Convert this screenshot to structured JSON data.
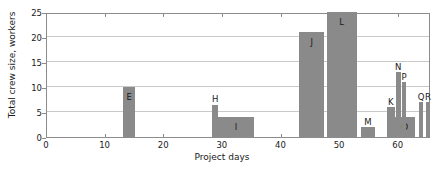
{
  "chart_data": {
    "type": "bar",
    "title": "",
    "xlabel": "Project days",
    "ylabel": "Total crew size, workers",
    "xlim": [
      0,
      65.5
    ],
    "ylim": [
      0,
      25
    ],
    "xticks": [
      0,
      10,
      20,
      30,
      40,
      50,
      60
    ],
    "yticks": [
      0,
      5,
      10,
      15,
      20,
      25
    ],
    "grid": true,
    "legend": null,
    "bar_color": "#8a8a8a",
    "axis_color": "#8c8c8c",
    "grid_color": "#c9c9c9",
    "bars": [
      {
        "label": "E",
        "start": 13.0,
        "end": 15.0,
        "value": 10,
        "label_inside": true
      },
      {
        "label": "H",
        "start": 28.2,
        "end": 29.2,
        "value": 6.5,
        "label_inside": false
      },
      {
        "label": "I",
        "start": 29.2,
        "end": 35.3,
        "value": 4,
        "label_inside": true
      },
      {
        "label": "J",
        "start": 43.0,
        "end": 47.3,
        "value": 21,
        "label_inside": true
      },
      {
        "label": "L",
        "start": 47.7,
        "end": 52.8,
        "value": 25,
        "label_inside": true
      },
      {
        "label": "M",
        "start": 53.5,
        "end": 56.0,
        "value": 2,
        "label_inside": false
      },
      {
        "label": "K",
        "start": 58.0,
        "end": 59.3,
        "value": 6,
        "label_inside": false
      },
      {
        "label": "O",
        "start": 59.3,
        "end": 62.8,
        "value": 4,
        "label_inside": true
      },
      {
        "label": "N",
        "start": 59.5,
        "end": 60.3,
        "value": 13,
        "label_inside": false
      },
      {
        "label": "P",
        "start": 60.5,
        "end": 61.3,
        "value": 11,
        "label_inside": false
      },
      {
        "label": "Q",
        "start": 63.4,
        "end": 64.2,
        "value": 7,
        "label_inside": false
      },
      {
        "label": "R",
        "start": 64.6,
        "end": 65.4,
        "value": 7,
        "label_inside": false
      }
    ]
  }
}
